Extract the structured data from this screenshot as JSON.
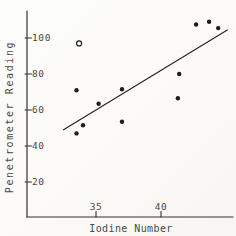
{
  "figure": {
    "paper_color": "#fbfaf7",
    "ink_color": "#222222",
    "text_color": "#4a4a4a"
  },
  "chart_data": {
    "type": "scatter",
    "title": "",
    "xlabel": "Iodine Number",
    "ylabel": "Penetrometer Reading",
    "xlim": [
      32.3,
      45.8
    ],
    "ylim": [
      8,
      115
    ],
    "x_ticks": [
      35,
      40
    ],
    "y_ticks": [
      100,
      80,
      60,
      40,
      20
    ],
    "grid": false,
    "legend": "none",
    "series": [
      {
        "name": "observations",
        "marker": "filled-circle",
        "color": "#1d1d1d",
        "points": [
          [
            33.5,
            71
          ],
          [
            35.2,
            63.5
          ],
          [
            34.0,
            51.5
          ],
          [
            33.5,
            47
          ],
          [
            37.0,
            71.5
          ],
          [
            37.0,
            53.5
          ],
          [
            41.4,
            80
          ],
          [
            41.3,
            66.5
          ],
          [
            42.7,
            107.5
          ],
          [
            43.7,
            109
          ],
          [
            44.4,
            105.5
          ]
        ]
      },
      {
        "name": "flagged-observation",
        "marker": "open-circle",
        "color": "#1d1d1d",
        "points": [
          [
            33.7,
            97
          ]
        ]
      }
    ],
    "fit_line": {
      "x1": 32.5,
      "y1": 49,
      "x2": 45.1,
      "y2": 104.5
    }
  }
}
